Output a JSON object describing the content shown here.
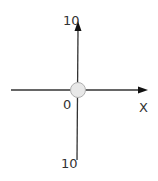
{
  "diagram": {
    "type": "number-line-axes",
    "labels": {
      "y_top": "10",
      "origin": "0",
      "x_axis": "X",
      "y_bottom": "10"
    },
    "colors": {
      "axis": "#1a1a1a",
      "origin_fill": "#e8e8e8",
      "origin_stroke": "#aaaaaa",
      "text": "#333333"
    }
  }
}
